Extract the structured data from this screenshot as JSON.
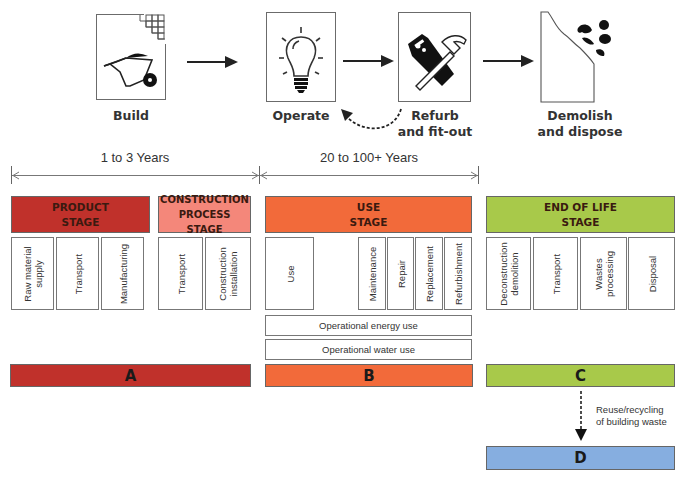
{
  "lifecycle_icons": [
    {
      "id": "build",
      "label": "Build",
      "icon": "wheelbarrow-icon"
    },
    {
      "id": "operate",
      "label": "Operate",
      "icon": "lightbulb-icon"
    },
    {
      "id": "refurb",
      "label_line1": "Refurb",
      "label_line2": "and fit-out",
      "icon": "saw-hammer-icon"
    },
    {
      "id": "demolish",
      "label_line1": "Demolish",
      "label_line2": "and dispose",
      "icon": "rubble-icon"
    }
  ],
  "timespans": [
    {
      "label": "1 to 3 Years"
    },
    {
      "label": "20 to 100+ Years"
    }
  ],
  "stages": {
    "product": {
      "line1": "PRODUCT",
      "line2": "STAGE",
      "color": "#c0312b",
      "modules": [
        {
          "line1": "Raw material",
          "line2": "supply"
        },
        {
          "line1": "Transport"
        },
        {
          "line1": "Manufacturing"
        }
      ]
    },
    "construction": {
      "line1": "CONSTRUCTION",
      "line2": "PROCESS STAGE",
      "color": "#f4877a",
      "modules": [
        {
          "line1": "Transport"
        },
        {
          "line1": "Construction",
          "line2": "installation"
        }
      ]
    },
    "use": {
      "line1": "USE",
      "line2": "STAGE",
      "color": "#f26a3a",
      "modules": [
        {
          "line1": "Use"
        },
        {
          "line1": "Maintenance"
        },
        {
          "line1": "Repair"
        },
        {
          "line1": "Replacement"
        },
        {
          "line1": "Refurbishment"
        }
      ],
      "operational": [
        "Operational energy use",
        "Operational water use"
      ]
    },
    "end_of_life": {
      "line1": "END OF LIFE",
      "line2": "STAGE",
      "color": "#a8c94a",
      "modules": [
        {
          "line1": "Deconstruction",
          "line2": "demolition"
        },
        {
          "line1": "Transport"
        },
        {
          "line1": "Wastes",
          "line2": "processing"
        },
        {
          "line1": "Disposal"
        }
      ]
    }
  },
  "letters": [
    {
      "label": "A",
      "color": "#c0312b"
    },
    {
      "label": "B",
      "color": "#f26a3a"
    },
    {
      "label": "C",
      "color": "#a8c94a"
    },
    {
      "label": "D",
      "color": "#86aee0"
    }
  ],
  "recycling_note": {
    "line1": "Reuse/recycling",
    "line2": "of building waste"
  }
}
